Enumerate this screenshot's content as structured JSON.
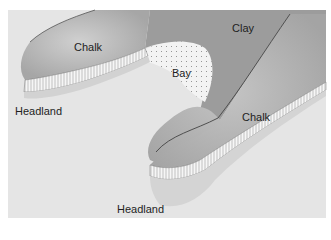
{
  "diagram": {
    "type": "headland-and-bay cross section",
    "labels": {
      "chalk_left": "Chalk",
      "clay": "Clay",
      "bay": "Bay",
      "headland_left": "Headland",
      "chalk_right": "Chalk",
      "headland_right": "Headland"
    },
    "colors": {
      "background": "#ffffff",
      "sea": "#e6e6e6",
      "chalk": "#a9a9a9",
      "chalk_highlight": "#c9c9c9",
      "clay": "#9a9a9a",
      "cliff": "#f4f4f4",
      "beach": "#ececec",
      "outline": "#555555"
    }
  }
}
